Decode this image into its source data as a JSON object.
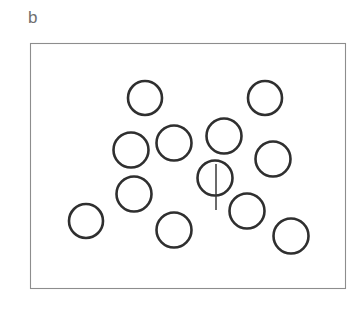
{
  "figure": {
    "panel_label": "b",
    "label_color": "#6f6f6f",
    "background_color": "#ffffff",
    "frame": {
      "x": 30,
      "y": 43,
      "width": 315,
      "height": 245,
      "stroke_color": "#8d8d8d",
      "stroke_width": 1.1
    },
    "circle_style": {
      "stroke_color": "#2f2f2f",
      "fill_color": "#ffffff",
      "stroke_width": 2.6
    },
    "stem_style": {
      "stroke_color": "#3a3a3a",
      "stroke_width": 1.5
    }
  },
  "chart_data": {
    "type": "scatter",
    "title": "b",
    "subtitle": "",
    "xlabel": "",
    "ylabel": "",
    "grid": false,
    "legend": null,
    "axis_visible": false,
    "xlim": [
      30,
      345
    ],
    "ylim": [
      43,
      288
    ],
    "marker": "open-circle",
    "point_count": 12,
    "series": [
      {
        "name": "particles",
        "marker": "open-circle",
        "points": [
          {
            "id": "circle-1",
            "x": 145,
            "y": 98,
            "r": 17.0,
            "stem": false
          },
          {
            "id": "circle-2",
            "x": 265,
            "y": 98,
            "r": 17.0,
            "stem": false
          },
          {
            "id": "circle-3",
            "x": 131,
            "y": 150,
            "r": 17.5,
            "stem": false
          },
          {
            "id": "circle-4",
            "x": 174,
            "y": 143,
            "r": 17.5,
            "stem": false
          },
          {
            "id": "circle-5",
            "x": 224,
            "y": 136,
            "r": 17.5,
            "stem": false
          },
          {
            "id": "circle-6",
            "x": 273,
            "y": 159,
            "r": 17.5,
            "stem": false
          },
          {
            "id": "circle-7",
            "x": 215,
            "y": 178,
            "r": 17.5,
            "stem": true,
            "stem_x": 216,
            "stem_y1": 164,
            "stem_y2": 210
          },
          {
            "id": "circle-8",
            "x": 134,
            "y": 194,
            "r": 17.5,
            "stem": false
          },
          {
            "id": "circle-9",
            "x": 86,
            "y": 221,
            "r": 17.0,
            "stem": false
          },
          {
            "id": "circle-10",
            "x": 174,
            "y": 230,
            "r": 17.5,
            "stem": false
          },
          {
            "id": "circle-11",
            "x": 247,
            "y": 211,
            "r": 17.5,
            "stem": false
          },
          {
            "id": "circle-12",
            "x": 291,
            "y": 236,
            "r": 17.5,
            "stem": false
          }
        ]
      }
    ],
    "annotations": [
      {
        "id": "stem-marker",
        "type": "line",
        "description": "vertical stem attached to circle-7 extending downward",
        "x": 216,
        "y1": 164,
        "y2": 210
      }
    ]
  }
}
